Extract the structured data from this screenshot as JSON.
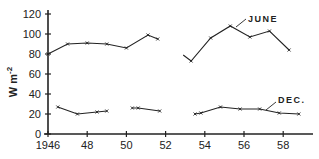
{
  "chart_data": {
    "type": "line",
    "title": "",
    "xlabel": "",
    "ylabel": "W m-2",
    "ylabel_main": "W m",
    "ylabel_sup": "-2",
    "xlim": [
      1946,
      1959.5
    ],
    "ylim": [
      0,
      120
    ],
    "grid": false,
    "legend": "inline labels",
    "x_ticks": [
      1946,
      1948,
      1950,
      1952,
      1954,
      1956,
      1958
    ],
    "x_tick_labels": [
      "1946",
      "48",
      "50",
      "52",
      "54",
      "56",
      "58"
    ],
    "y_ticks": [
      0,
      20,
      40,
      60,
      80,
      100,
      120
    ],
    "y_tick_labels": [
      "0",
      "20",
      "40",
      "60",
      "80",
      "100",
      "120"
    ],
    "series": [
      {
        "name": "JUNE",
        "label": "JUNE",
        "segments": [
          [
            [
              1946.0,
              80
            ],
            [
              1947.0,
              90
            ],
            [
              1948.0,
              91
            ],
            [
              1949.0,
              90
            ],
            [
              1950.0,
              86
            ],
            [
              1951.1,
              99
            ],
            [
              1951.6,
              95
            ]
          ],
          [
            [
              1952.9,
              79
            ],
            [
              1953.3,
              73
            ],
            [
              1954.3,
              96
            ],
            [
              1955.3,
              108
            ],
            [
              1956.3,
              97
            ],
            [
              1957.3,
              103
            ],
            [
              1958.3,
              84
            ]
          ]
        ]
      },
      {
        "name": "DEC.",
        "label": "DEC.",
        "segments": [
          [
            [
              1946.5,
              27
            ],
            [
              1947.5,
              20
            ],
            [
              1948.5,
              22
            ],
            [
              1949.0,
              23
            ]
          ],
          [
            [
              1950.3,
              26
            ],
            [
              1950.6,
              26
            ],
            [
              1951.7,
              23
            ]
          ],
          [
            [
              1953.5,
              20
            ],
            [
              1953.8,
              21
            ],
            [
              1954.8,
              27
            ],
            [
              1955.8,
              25
            ],
            [
              1956.8,
              25
            ],
            [
              1957.8,
              21
            ],
            [
              1958.8,
              20
            ]
          ]
        ]
      }
    ]
  }
}
